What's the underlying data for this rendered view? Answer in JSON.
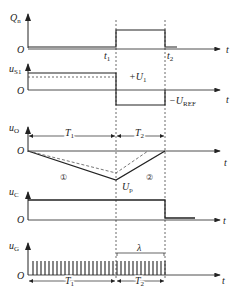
{
  "diagram": {
    "type": "timing-diagram",
    "time_axis_label": "t",
    "origin_label": "O",
    "markers": {
      "t1": "t",
      "t1_sub": "1",
      "t2": "t",
      "t2_sub": "2"
    },
    "rows": [
      {
        "id": "Qn",
        "label": "Q",
        "label_sub": "n"
      },
      {
        "id": "uS1",
        "label": "u",
        "label_sub": "S1",
        "pos_level": "+U",
        "pos_level_sub": "1",
        "neg_level": "−U",
        "neg_level_sub": "REF"
      },
      {
        "id": "uO",
        "label": "u",
        "label_sub": "O",
        "interval1": "T",
        "interval1_sub": "1",
        "interval2": "T",
        "interval2_sub": "2",
        "peak": "U",
        "peak_sub": "p",
        "curve1": "①",
        "curve2": "②"
      },
      {
        "id": "uC",
        "label": "u",
        "label_sub": "C"
      },
      {
        "id": "uG",
        "label": "u",
        "label_sub": "G",
        "count_label": "λ",
        "interval1": "T",
        "interval1_sub": "1",
        "interval2": "T",
        "interval2_sub": "2"
      }
    ]
  }
}
